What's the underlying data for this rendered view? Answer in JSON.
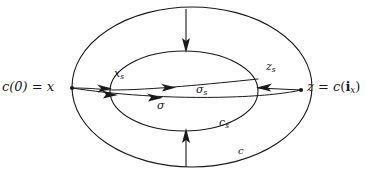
{
  "figure": {
    "background_color": "#ffffff",
    "ink_color": "#1a1a1a",
    "width": 373,
    "height": 174
  },
  "labels": {
    "left_endpoint": {
      "text": "c(0) = x",
      "parts": {
        "c": "c",
        "paren_open": "(",
        "zero": "0",
        "paren_close": ")",
        "equals": "=",
        "x": "x"
      }
    },
    "right_endpoint": {
      "text": "z = c(i_x)",
      "parts": {
        "z": "z",
        "equals": "=",
        "c": "c",
        "paren_open": "(",
        "i_bold": "i",
        "sub_x": "x",
        "paren_close": ")"
      }
    },
    "inner_left_point": {
      "base": "x",
      "sub": "s",
      "text": "x_s"
    },
    "inner_right_point": {
      "base": "z",
      "sub": "s",
      "text": "z_s"
    },
    "upper_shortcut": {
      "base": "σ",
      "sub": "s",
      "text": "σ_s"
    },
    "lower_shortcut": {
      "base": "σ",
      "sub": "",
      "text": "σ"
    },
    "inner_loop": {
      "base": "c",
      "sub": "s",
      "text": "c_s"
    },
    "outer_loop": {
      "base": "c",
      "sub": "",
      "text": "c"
    }
  },
  "elements": {
    "outer_ellipse_name": "outer-loop-c",
    "inner_ellipse_name": "inner-loop-cs",
    "top_arrow_direction": "down",
    "bottom_arrow_direction": "up",
    "sigma_s_arrow_direction": "right",
    "sigma_arrow_direction": "right",
    "z_s_arrow_direction": "left"
  }
}
